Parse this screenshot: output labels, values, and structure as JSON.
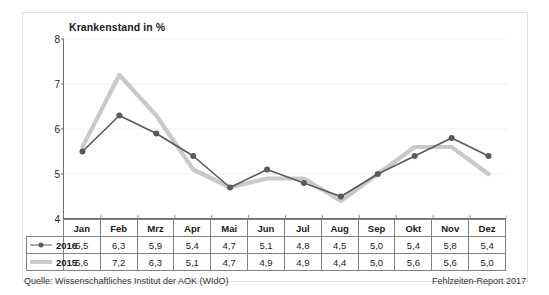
{
  "chart_data": {
    "type": "line",
    "title": "Krankenstand in %",
    "xlabel": "",
    "ylabel": "",
    "ylim": [
      4,
      8
    ],
    "yticks": [
      "4",
      "5",
      "6",
      "7",
      "8"
    ],
    "grid": true,
    "legend_position": "table-left",
    "categories": [
      "Jan",
      "Feb",
      "Mrz",
      "Apr",
      "Mai",
      "Jun",
      "Jul",
      "Aug",
      "Sep",
      "Okt",
      "Nov",
      "Dez"
    ],
    "series": [
      {
        "name": "2016",
        "color": "#5a5a5a",
        "marker": "circle",
        "values": [
          5.5,
          6.3,
          5.9,
          5.4,
          4.7,
          5.1,
          4.8,
          4.5,
          5.0,
          5.4,
          5.8,
          5.4
        ],
        "labels": [
          "5,5",
          "6,3",
          "5,9",
          "5,4",
          "4,7",
          "5,1",
          "4,8",
          "4,5",
          "5,0",
          "5,4",
          "5,8",
          "5,4"
        ]
      },
      {
        "name": "2015",
        "color": "#c9c9c9",
        "marker": "none",
        "values": [
          5.6,
          7.2,
          6.3,
          5.1,
          4.7,
          4.9,
          4.9,
          4.4,
          5.0,
          5.6,
          5.6,
          5.0
        ],
        "labels": [
          "5,6",
          "7,2",
          "6,3",
          "5,1",
          "4,7",
          "4,9",
          "4,9",
          "4,4",
          "5,0",
          "5,6",
          "5,6",
          "5,0"
        ]
      }
    ]
  },
  "footer": {
    "source": "Quelle: Wissenschaftliches Institut der AOK (WIdO)",
    "report": "Fehlzeiten-Report 2017"
  }
}
